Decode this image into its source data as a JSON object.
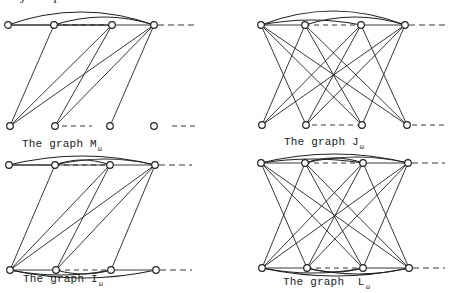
{
  "figure": {
    "top_cut_glyphs": [
      {
        "text": "J",
        "x": 20
      },
      {
        "text": "I",
        "x": 53
      }
    ],
    "colors": {
      "stroke": "#222222",
      "background": "#ffffff"
    },
    "panels": [
      {
        "id": "M",
        "caption": {
          "prefix": "The graph ",
          "letter": "M",
          "sub": "ω",
          "x": 22,
          "y": 144
        },
        "top": {
          "y": 25,
          "xs": [
            8,
            54,
            112,
            154
          ],
          "tail_to": 195,
          "dash_from": [
            {
              "a": 1,
              "b": 2
            }
          ]
        },
        "bottom": {
          "y": 126,
          "xs": [
            10,
            55,
            110,
            154
          ],
          "dashes": [
            [
              62,
              92
            ],
            [
              172,
              195
            ]
          ]
        },
        "bottom_edges_visible": false,
        "top_arcs": [
          [
            0,
            3,
            13
          ],
          [
            1,
            3,
            8
          ],
          [
            0,
            2,
            0
          ],
          [
            1,
            2,
            0
          ]
        ],
        "bottom_arcs": [],
        "cross_edges": [
          [
            1,
            0
          ],
          [
            2,
            0
          ],
          [
            2,
            1
          ],
          [
            3,
            0
          ],
          [
            3,
            1
          ],
          [
            3,
            2
          ]
        ]
      },
      {
        "id": "J",
        "caption": {
          "prefix": "The graph ",
          "letter": "J",
          "sub": "ω",
          "x": 284,
          "y": 142
        },
        "top": {
          "y": 25,
          "xs": [
            261,
            305,
            361,
            405
          ],
          "tail_to": 447,
          "dash_from": [
            {
              "a": 1,
              "b": 2
            }
          ]
        },
        "bottom": {
          "y": 125,
          "xs": [
            262,
            306,
            362,
            407
          ],
          "dashes": [
            [
              312,
              358
            ],
            [
              412,
              445
            ]
          ]
        },
        "bottom_edges_visible": false,
        "top_arcs": [
          [
            0,
            3,
            14
          ],
          [
            0,
            2,
            5
          ],
          [
            1,
            3,
            8
          ]
        ],
        "bottom_arcs": [],
        "cross_edges": [
          [
            0,
            1
          ],
          [
            0,
            2
          ],
          [
            0,
            3
          ],
          [
            1,
            0
          ],
          [
            1,
            2
          ],
          [
            1,
            3
          ],
          [
            2,
            0
          ],
          [
            2,
            1
          ],
          [
            2,
            3
          ],
          [
            3,
            0
          ],
          [
            3,
            1
          ],
          [
            3,
            2
          ]
        ]
      },
      {
        "id": "I",
        "caption": {
          "prefix": "The graph ",
          "letter": "I",
          "sub": "ω",
          "x": 23,
          "y": 279
        },
        "top": {
          "y": 165,
          "xs": [
            9,
            55,
            110,
            155
          ],
          "tail_to": 192,
          "dash_from": [
            {
              "a": 1,
              "b": 2
            }
          ]
        },
        "bottom": {
          "y": 270,
          "xs": [
            10,
            56,
            111,
            156
          ],
          "tail_to": 192,
          "dashes": []
        },
        "bottom_edges_visible": true,
        "top_arcs": [
          [
            0,
            3,
            9
          ],
          [
            1,
            3,
            6
          ],
          [
            0,
            2,
            0
          ],
          [
            1,
            2,
            5
          ]
        ],
        "bottom_arcs": [
          [
            0,
            3,
            -8
          ],
          [
            0,
            2,
            -5
          ],
          [
            1,
            2,
            -4
          ]
        ],
        "cross_edges": [
          [
            1,
            0
          ],
          [
            2,
            0
          ],
          [
            2,
            1
          ],
          [
            3,
            0
          ],
          [
            3,
            1
          ],
          [
            3,
            2
          ]
        ]
      },
      {
        "id": "L",
        "caption": {
          "prefix": "The graph  ",
          "letter": "L",
          "sub": "ω",
          "x": 283,
          "y": 282
        },
        "top": {
          "y": 163,
          "xs": [
            261,
            305,
            363,
            408
          ],
          "tail_to": 445,
          "dash_from": [
            {
              "a": 1,
              "b": 2
            }
          ]
        },
        "bottom": {
          "y": 268,
          "xs": [
            262,
            307,
            363,
            409
          ],
          "tail_to": 445,
          "dashes": []
        },
        "bottom_edges_visible": true,
        "top_arcs": [
          [
            0,
            3,
            9
          ],
          [
            0,
            2,
            4
          ],
          [
            1,
            2,
            5
          ],
          [
            1,
            3,
            6
          ]
        ],
        "bottom_arcs": [
          [
            0,
            3,
            -8
          ],
          [
            0,
            2,
            -5
          ],
          [
            1,
            2,
            -4
          ],
          [
            1,
            3,
            -6
          ]
        ],
        "cross_edges": [
          [
            0,
            1
          ],
          [
            0,
            2
          ],
          [
            0,
            3
          ],
          [
            1,
            0
          ],
          [
            1,
            2
          ],
          [
            1,
            3
          ],
          [
            2,
            0
          ],
          [
            2,
            1
          ],
          [
            2,
            3
          ],
          [
            3,
            0
          ],
          [
            3,
            1
          ],
          [
            3,
            2
          ]
        ]
      }
    ]
  }
}
